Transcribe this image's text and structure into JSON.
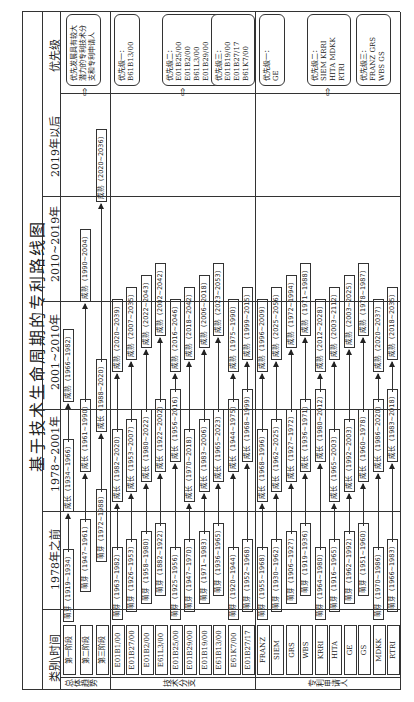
{
  "title": "基于技术生命周期的专利路线图",
  "header": {
    "category_time": "类别\\时间",
    "periods": [
      "1978年之前",
      "1978~2001年",
      "2001~2010年",
      "2010~2019年",
      "2019年以后"
    ],
    "priority": "优先级"
  },
  "sections": {
    "overall": {
      "label": "总体趋势",
      "rows": [
        "第一阶段",
        "第二阶段",
        "第三阶段"
      ],
      "priority_text": "优先发展具有较大潜力的专利技术分支和专利申请人"
    },
    "branches": {
      "label": "技术分支",
      "rows": [
        "E01B1/00",
        "E01B27/00",
        "E01B2/00",
        "E61L3/00",
        "E01B25/00",
        "E01B29/00",
        "E01B19/00",
        "E61B13/00",
        "E61K7/00",
        "E01B27/17"
      ],
      "priority": [
        "优先级一：\nB61B13/00",
        "优先级二：\nE01B25/00\nE01B2/00\nB61L3/00\nE01B29/00\nE01B1/00\nE01B27/00",
        "优先级三：\nE01B19/00\nE01B27/17\nB61K7/00"
      ]
    },
    "applicants": {
      "label": "专利申请人",
      "rows": [
        "FRANZ",
        "SIEM",
        "GRS",
        "WBS",
        "KRRI",
        "HITA",
        "GE",
        "GS",
        "MDKK",
        "RTRI"
      ],
      "priority": [
        "优先级一：\nGE",
        "优先级二：\nSIEM KRRI\nHITA MDKK\nRTRI",
        "优先级三：\nFRANZ GRS\nWBS GS"
      ]
    }
  },
  "stages": {
    "overall": [
      [
        "萌芽（1919~1934）",
        "成长（1934~1966）",
        "成熟（1966~1982）"
      ],
      [
        "萌芽（1947~1961）",
        "成长（1961~1990）",
        "成熟（1990~2004）"
      ],
      [
        "萌芽（1972~1988）",
        "成长（1988~2020）",
        "成熟（2020~2036）"
      ]
    ],
    "branches": [
      [
        "萌芽（1963~1982）",
        "成长（1982~2020）",
        "成熟（2020~2039）"
      ],
      [
        "萌芽（1926~1953）",
        "成长（1953~2007）",
        "成熟（2007~2035）"
      ],
      [
        "萌芽（1958~1980）",
        "成长（1980~2022）",
        "成熟（2022~2043）"
      ],
      [
        "萌芽（1882~1922）",
        "成长（1922~2002）",
        "成熟（2002~2042）"
      ],
      [
        "萌芽（1925~1956）",
        "成长（1956~2016）",
        "成熟（2016~2046）"
      ],
      [
        "萌芽（1947~1970）",
        "成长（1970~2018）",
        "成熟（2018~2042）"
      ],
      [
        "萌芽（1971~1983）",
        "成长（1983~2006）",
        "成熟（2006~2018）"
      ],
      [
        "萌芽（1936~1965）",
        "成长（1965~2023）",
        "成熟（2023~2053）"
      ],
      [
        "萌芽（1920~1944）",
        "成长（1944~1975）",
        "成熟（1975~1990）"
      ],
      [
        "萌芽（1952~1968）",
        "成长（1968~1999）",
        "成熟（1999~2015）"
      ]
    ],
    "applicants": [
      [
        "萌芽（1955~1968）",
        "成长（1968~1996）",
        "成熟（1996~2009）"
      ],
      [
        "萌芽（1930~1962）",
        "成长（1962~2025）",
        "成熟（2025~2056）"
      ],
      [
        "萌芽（1906~1927）",
        "成长（1927~1972）",
        "成熟（1972~1994）"
      ],
      [
        "萌芽（1919~1936）",
        "成长（1936~1971）",
        "成熟（1971~1988）"
      ],
      [
        "萌芽（1964~1980）",
        "成长（1980~2012）",
        "成熟（2012~2028）"
      ],
      [
        "萌芽（1916~1965）",
        "成长（1965~2003）",
        "成熟（2003~2112）"
      ],
      [
        "萌芽（1962~1992）",
        "成长（1992~2003）",
        "成熟（2003~2025）"
      ],
      [
        "萌芽（1951~1960）",
        "成长（1960~1978）",
        "成熟（1978~1987）"
      ],
      [
        "萌芽（1970~1986）",
        "成长（1986~2020）",
        "成熟（2020~2037）"
      ],
      [
        "萌芽（1966~1983）",
        "成长（1983~2018）",
        "成熟（2018~2035）"
      ]
    ]
  }
}
